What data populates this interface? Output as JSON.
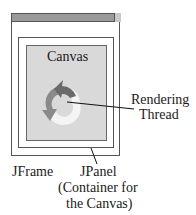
{
  "diagram": {
    "type": "component-nesting",
    "components": {
      "frame": {
        "label": "JFrame"
      },
      "panel": {
        "label_line1": "JPanel",
        "label_line2": "(Container for",
        "label_line3": "the Canvas)"
      },
      "canvas": {
        "label": "Canvas"
      },
      "thread": {
        "label_line1": "Rendering",
        "label_line2": "Thread",
        "icon": "circular-arrows-icon"
      }
    },
    "colors": {
      "border": "#555555",
      "titlebar": "#9a9a9a",
      "canvas_bg": "#d9d9d9",
      "arrow_dark": "#6a6a6a",
      "arrow_mid": "#8a8a8a",
      "arrow_light": "#f4f4f4"
    }
  }
}
